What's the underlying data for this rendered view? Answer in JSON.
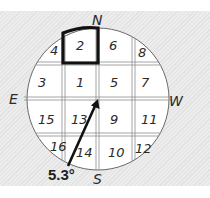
{
  "diagram": {
    "compass": {
      "north": "N",
      "south": "S",
      "east": "E",
      "west": "W"
    },
    "cells": [
      {
        "id": "4",
        "label": "4"
      },
      {
        "id": "2",
        "label": "2",
        "highlighted": true
      },
      {
        "id": "6",
        "label": "6"
      },
      {
        "id": "8",
        "label": "8"
      },
      {
        "id": "3",
        "label": "3"
      },
      {
        "id": "1",
        "label": "1"
      },
      {
        "id": "5",
        "label": "5"
      },
      {
        "id": "7",
        "label": "7"
      },
      {
        "id": "15",
        "label": "15"
      },
      {
        "id": "13",
        "label": "13"
      },
      {
        "id": "9",
        "label": "9"
      },
      {
        "id": "11",
        "label": "11"
      },
      {
        "id": "16",
        "label": "16"
      },
      {
        "id": "14",
        "label": "14"
      },
      {
        "id": "10",
        "label": "10"
      },
      {
        "id": "12",
        "label": "12"
      }
    ],
    "arrow": {
      "angle_label": "5.3°"
    },
    "colors": {
      "ink": "#1e1e1e",
      "grid": "#9a9a9a",
      "background": "#e6e6e6",
      "circle_fill": "#ffffff"
    }
  }
}
